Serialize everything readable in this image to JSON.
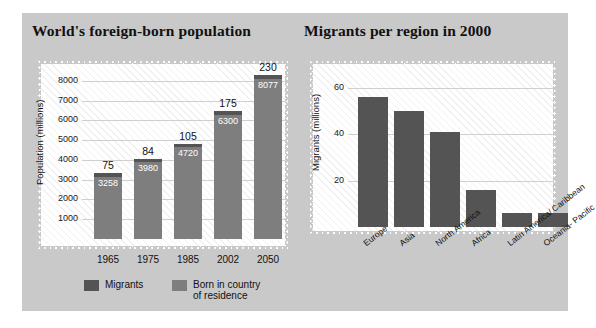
{
  "card": {
    "background": "#c9c9c9"
  },
  "colors": {
    "migrants": "#545454",
    "born_in_country": "#7e7e7e",
    "panel_bg": "#ffffff",
    "gridline": "#cfcfcf",
    "text": "#111111"
  },
  "left_chart": {
    "title": "World's foreign-born population",
    "legend": [
      {
        "label": "Migrants",
        "color": "#545454"
      },
      {
        "label": "Born in country\nof residence",
        "color": "#7e7e7e"
      }
    ]
  },
  "right_chart": {
    "title": "Migrants per region in 2000"
  },
  "chart_data": [
    {
      "type": "bar",
      "id": "worlds-foreign-born-population",
      "title": "World's foreign-born population",
      "stacked": true,
      "xlabel": "",
      "ylabel": "Population (millions)",
      "ylim": [
        0,
        8500
      ],
      "yticks": [
        1000,
        2000,
        3000,
        4000,
        5000,
        6000,
        7000,
        8000
      ],
      "grid": true,
      "legend_position": "bottom",
      "categories": [
        "1965",
        "1975",
        "1985",
        "2002",
        "2050"
      ],
      "series": [
        {
          "name": "Born in country of residence",
          "color": "#7e7e7e",
          "values": [
            3258,
            3980,
            4720,
            6300,
            8077
          ]
        },
        {
          "name": "Migrants",
          "color": "#545454",
          "values": [
            75,
            84,
            105,
            175,
            230
          ]
        }
      ],
      "inside_labels": [
        "3258",
        "3980",
        "4720",
        "6300",
        "8077"
      ],
      "top_labels": [
        "75",
        "84",
        "105",
        "175",
        "230"
      ]
    },
    {
      "type": "bar",
      "id": "migrants-per-region-2000",
      "title": "Migrants per region in 2000",
      "stacked": false,
      "xlabel": "",
      "ylabel": "Migrants (millions)",
      "ylim": [
        0,
        68
      ],
      "yticks": [
        20,
        40,
        60
      ],
      "grid": true,
      "legend_position": "none",
      "categories": [
        "Europe",
        "Asia",
        "North America",
        "Africa",
        "Latin America/\nCaribbean",
        "Oceania-\nPacific"
      ],
      "values": [
        56,
        50,
        41,
        16,
        6,
        6
      ],
      "series": [
        {
          "name": "Migrants",
          "color": "#545454",
          "values": [
            56,
            50,
            41,
            16,
            6,
            6
          ]
        }
      ]
    }
  ]
}
